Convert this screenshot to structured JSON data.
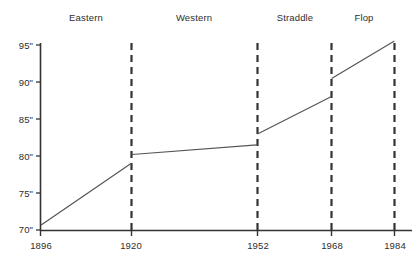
{
  "chart_data": {
    "type": "line",
    "title": "",
    "subtitle": "",
    "xlabel": "",
    "ylabel": "",
    "grid": false,
    "legend_position": "none",
    "xlim": [
      1896,
      1984
    ],
    "ylim": [
      70,
      95
    ],
    "x_tick_labels": [
      "1896",
      "1920",
      "1952",
      "1968",
      "1984"
    ],
    "x_ticks": [
      1896,
      1920,
      1952,
      1968,
      1984
    ],
    "y_tick_labels": [
      "70\"",
      "75\"",
      "80\"",
      "85\"",
      "90\"",
      "95\""
    ],
    "y_ticks": [
      70,
      75,
      80,
      85,
      90,
      95
    ],
    "era_labels": [
      "Eastern",
      "Western",
      "Straddle",
      "Flop"
    ],
    "eras": [
      {
        "name": "Eastern",
        "start_year": 1896,
        "end_year": 1920,
        "start_value": 70.7,
        "end_value": 79.0,
        "label_year": 1908
      },
      {
        "name": "Western",
        "start_year": 1920,
        "end_year": 1952,
        "start_value": 80.2,
        "end_value": 81.5,
        "label_year": 1936
      },
      {
        "name": "Straddle",
        "start_year": 1952,
        "end_year": 1968,
        "start_value": 83.0,
        "end_value": 88.0,
        "label_year": 1960
      },
      {
        "name": "Flop",
        "start_year": 1968,
        "end_year": 1984,
        "start_value": 90.5,
        "end_value": 95.5,
        "label_year": 1976
      }
    ],
    "divider_years": [
      1920,
      1952,
      1968,
      1984
    ],
    "series": [
      {
        "name": "High jump record height",
        "x": [
          1896,
          1920,
          1920,
          1952,
          1952,
          1968,
          1968,
          1984
        ],
        "values": [
          70.7,
          79.0,
          80.2,
          81.5,
          83.0,
          88.0,
          90.5,
          95.5
        ]
      }
    ],
    "colors": {
      "line": "#555555",
      "axis": "#333333",
      "divider": "#333333",
      "text": "#2e2e2e",
      "background": "#ffffff"
    }
  }
}
